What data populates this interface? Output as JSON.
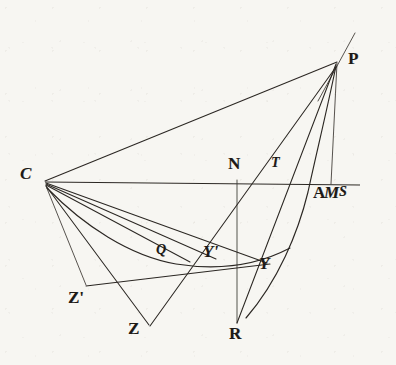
{
  "figure": {
    "kind": "geometry-diagram",
    "ink_color": "#2b2723",
    "paper_color": "#f7f6f2",
    "width": 396,
    "height": 365
  },
  "labels": [
    {
      "name": "label-P",
      "text": "P",
      "x": 348,
      "y": 50,
      "size": "normal",
      "style": "upright"
    },
    {
      "name": "label-C",
      "text": "C",
      "x": 20,
      "y": 165,
      "size": "normal",
      "style": "italic"
    },
    {
      "name": "label-N",
      "text": "N",
      "x": 228,
      "y": 155,
      "size": "normal",
      "style": "upright"
    },
    {
      "name": "label-T",
      "text": "T",
      "x": 271,
      "y": 156,
      "size": "small",
      "style": "italic"
    },
    {
      "name": "label-A",
      "text": "A",
      "x": 313,
      "y": 184,
      "size": "normal",
      "style": "upright"
    },
    {
      "name": "label-M",
      "text": "M",
      "x": 324,
      "y": 184,
      "size": "normal",
      "style": "italic"
    },
    {
      "name": "label-S",
      "text": "S",
      "x": 339,
      "y": 184,
      "size": "small",
      "style": "italic"
    },
    {
      "name": "label-Q",
      "text": "Q",
      "x": 156,
      "y": 243,
      "size": "small",
      "style": "italic"
    },
    {
      "name": "label-Yprime",
      "text": "Y'",
      "x": 203,
      "y": 243,
      "size": "normal",
      "style": "italic"
    },
    {
      "name": "label-Y",
      "text": "Y",
      "x": 259,
      "y": 255,
      "size": "normal",
      "style": "italic"
    },
    {
      "name": "label-Zprime",
      "text": "Z'",
      "x": 68,
      "y": 289,
      "size": "normal",
      "style": "upright"
    },
    {
      "name": "label-Z",
      "text": "Z",
      "x": 128,
      "y": 320,
      "size": "normal",
      "style": "upright"
    },
    {
      "name": "label-R",
      "text": "R",
      "x": 229,
      "y": 325,
      "size": "normal",
      "style": "upright"
    }
  ],
  "points": {
    "C": {
      "x": 44,
      "y": 181
    },
    "P": {
      "x": 337,
      "y": 61
    },
    "N": {
      "x": 237,
      "y": 182
    },
    "R": {
      "x": 237,
      "y": 322
    },
    "M": {
      "x": 330,
      "y": 183
    },
    "A": {
      "x": 312,
      "y": 183
    },
    "S": {
      "x": 348,
      "y": 184
    },
    "T": {
      "x": 283,
      "y": 182
    },
    "Q": {
      "x": 166,
      "y": 258
    },
    "Yprime": {
      "x": 216,
      "y": 259
    },
    "Y": {
      "x": 267,
      "y": 263
    },
    "Z": {
      "x": 148,
      "y": 324
    },
    "Zprime": {
      "x": 85,
      "y": 284
    }
  },
  "segments": [
    {
      "name": "segment-C-P",
      "from": "C",
      "to": "P"
    },
    {
      "name": "segment-axis-C-S",
      "from": "C",
      "to": "S"
    },
    {
      "name": "segment-P-M",
      "from": "P",
      "to": "M"
    },
    {
      "name": "segment-N-R",
      "from": "N",
      "to": "R"
    },
    {
      "name": "segment-P-R",
      "from": "P",
      "to": "R"
    },
    {
      "name": "segment-C-Y",
      "from": "C",
      "to": "Y"
    },
    {
      "name": "segment-C-Yprime",
      "from": "C",
      "to": "Yprime"
    },
    {
      "name": "segment-C-Q",
      "from": "C",
      "to": "Q"
    },
    {
      "name": "segment-C-Zprime",
      "from": "C",
      "to": "Zprime"
    },
    {
      "name": "segment-C-Z",
      "from": "C",
      "to": "Z"
    },
    {
      "name": "segment-Zprime-Y",
      "from": "Zprime",
      "to": "Y"
    },
    {
      "name": "segment-Z-P",
      "from": "Z",
      "to": "P"
    }
  ],
  "curves": [
    {
      "name": "curve-conic-through-A",
      "note": "conic arc from P through A down past R"
    },
    {
      "name": "curve-auxiliary-circle",
      "note": "auxiliary arc from C through Q and Y-prime to Y"
    },
    {
      "name": "curve-tangent-at-P",
      "note": "tangent line extending beyond P"
    }
  ]
}
